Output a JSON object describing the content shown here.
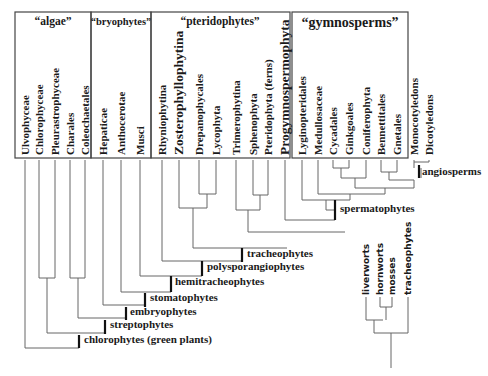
{
  "groups": [
    {
      "id": "algae",
      "label": "“algae”",
      "x": 15,
      "y": 12,
      "w": 76,
      "h": 146,
      "label_x": 53,
      "label_y": 25,
      "size": 11.5
    },
    {
      "id": "bryophytes",
      "label": "“bryophytes”",
      "x": 91,
      "y": 12,
      "w": 60,
      "h": 146,
      "label_x": 121,
      "label_y": 25,
      "size": 10.5
    },
    {
      "id": "pteridophytes",
      "label": "“pteridophytes”",
      "x": 151,
      "y": 12,
      "w": 139,
      "h": 146,
      "label_x": 220,
      "label_y": 25,
      "size": 11.5
    },
    {
      "id": "gymnosperms",
      "label": "“gymnosperms”",
      "x": 292,
      "y": 12,
      "w": 116,
      "h": 146,
      "label_x": 350,
      "label_y": 27,
      "size": 14
    }
  ],
  "taxa": [
    {
      "name": "Ulvophyceae",
      "x": 25,
      "size": 11
    },
    {
      "name": "Chlorophyceae",
      "x": 39,
      "size": 11
    },
    {
      "name": "Pleurastrophyceae",
      "x": 55,
      "size": 11
    },
    {
      "name": "Charales",
      "x": 70,
      "size": 11
    },
    {
      "name": "Coleochaetales",
      "x": 85,
      "size": 11
    },
    {
      "name": "Hepaticae",
      "x": 103,
      "size": 11
    },
    {
      "name": "Anthocerotae",
      "x": 121,
      "size": 11
    },
    {
      "name": "Musci",
      "x": 140,
      "size": 11
    },
    {
      "name": "Rhyniophytina",
      "x": 162,
      "size": 11
    },
    {
      "name": "Zosterophyllophytina",
      "x": 179,
      "size": 13.5
    },
    {
      "name": "Drepanophycales",
      "x": 199,
      "size": 11
    },
    {
      "name": "Lycophyta",
      "x": 216,
      "size": 11
    },
    {
      "name": "Trimerophytina",
      "x": 236,
      "size": 11
    },
    {
      "name": "Sphenophyta",
      "x": 253,
      "size": 11
    },
    {
      "name": "Pteridophyta (ferns)",
      "x": 268,
      "size": 11
    },
    {
      "name": "Progymnospermophyta",
      "x": 285,
      "size": 13.5
    },
    {
      "name": "Lyginopteridales",
      "x": 302,
      "size": 11
    },
    {
      "name": "Medullosaceae",
      "x": 318,
      "size": 11
    },
    {
      "name": "Cycadales",
      "x": 333,
      "size": 11
    },
    {
      "name": "Ginkgoales",
      "x": 349,
      "size": 11
    },
    {
      "name": "Coniferophyta",
      "x": 366,
      "size": 11
    },
    {
      "name": "Bennettitales",
      "x": 381,
      "size": 11
    },
    {
      "name": "Gnetales",
      "x": 397,
      "size": 11
    },
    {
      "name": "Monocotyledons",
      "x": 414,
      "size": 11
    },
    {
      "name": "Dicotyledons",
      "x": 429,
      "size": 11
    }
  ],
  "clades": [
    {
      "name": "angiosperms",
      "marker_x": 419,
      "marker_y1": 165,
      "marker_y2": 178,
      "label_x": 422,
      "label_y": 175
    },
    {
      "name": "spermatophytes",
      "marker_x": 335,
      "marker_y1": 200,
      "marker_y2": 220,
      "label_x": 340,
      "label_y": 212
    },
    {
      "name": "tracheophytes",
      "marker_x": 242,
      "marker_y1": 248,
      "marker_y2": 262,
      "label_x": 247,
      "label_y": 257
    },
    {
      "name": "polysporangiophytes",
      "marker_x": 202,
      "marker_y1": 261,
      "marker_y2": 276,
      "label_x": 207,
      "label_y": 270
    },
    {
      "name": "hemitracheophytes",
      "marker_x": 171,
      "marker_y1": 276,
      "marker_y2": 292,
      "label_x": 175,
      "label_y": 285
    },
    {
      "name": "stomatophytes",
      "marker_x": 145,
      "marker_y1": 293,
      "marker_y2": 307,
      "label_x": 150,
      "label_y": 301
    },
    {
      "name": "embryophytes",
      "marker_x": 126,
      "marker_y1": 307,
      "marker_y2": 320,
      "label_x": 130,
      "label_y": 315
    },
    {
      "name": "streptophytes",
      "marker_x": 105,
      "marker_y1": 320,
      "marker_y2": 334,
      "label_x": 110,
      "label_y": 328
    },
    {
      "name": "chlorophytes (green plants)",
      "marker_x": 79,
      "marker_y1": 335,
      "marker_y2": 348,
      "label_x": 84,
      "label_y": 343
    }
  ],
  "branches": [
    "M25,160 V348 H79",
    "M39,160 V278 H55 V160",
    "M47,278 V333 H105",
    "M70,160 V278 H85 V160",
    "M78,278 V318 H126",
    "M103,160 V305 H145",
    "M121,160 V292 H171",
    "M140,160 V276 H202",
    "M162,160 V261 H242",
    "M199,160 V194 H216 V160",
    "M207,194 V208 H179 V160",
    "M193,208 V248 H287",
    "M253,160 V195 H268 V160",
    "M260,195 V210 H236 V160",
    "M248,210 V232 H345",
    "M285,160 V220 H335",
    "M333,160 V168 H349 V160",
    "M341,168 V178 H366 V160",
    "M381,160 V172 H397 V160",
    "M389,172 V180 H414",
    "M414,162 H429 V160",
    "M414,160 V168 M421,168 V178",
    "M355,178 V188 H414 V180",
    "M318,160 V194 H385 V188",
    "M302,160 V200 H350 V194",
    "M326,200 V210 H335"
  ],
  "inset": {
    "taxa": [
      {
        "name": "liverworts",
        "x": 366,
        "y_tip": 297
      },
      {
        "name": "hornworts",
        "x": 380,
        "y_tip": 297
      },
      {
        "name": "mosses",
        "x": 392,
        "y_tip": 297
      },
      {
        "name": "tracheophytes",
        "x": 408,
        "y_tip": 297
      }
    ],
    "branches": [
      "M366,297 V320 H383",
      "M380,297 V307 H392 V297",
      "M386,307 V320",
      "M374,320 V333 H408 V297",
      "M391,333 V368"
    ]
  }
}
